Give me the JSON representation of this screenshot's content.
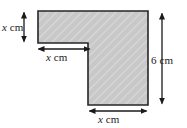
{
  "figure": {
    "kind": "composite-l-shape-diagram",
    "background_color": "#ffffff",
    "shape": {
      "name": "l-shape",
      "fill_color": "#c8c8c8",
      "stroke_color": "#262626",
      "hatch_color": "#ffffff",
      "hatch_angle_deg": 45,
      "vertices": [
        [
          38,
          11
        ],
        [
          148,
          11
        ],
        [
          148,
          105
        ],
        [
          88,
          105
        ],
        [
          88,
          43
        ],
        [
          38,
          43
        ]
      ]
    },
    "dimension_labels": [
      {
        "id": "left-height",
        "variable": "x",
        "unit": "cm",
        "text": "x cm",
        "orientation": "vertical",
        "measures": "left arm height"
      },
      {
        "id": "notch-width",
        "variable": "x",
        "unit": "cm",
        "text": "x cm",
        "orientation": "horizontal",
        "measures": "left arm width"
      },
      {
        "id": "right-height",
        "variable": "6",
        "unit": "cm",
        "text": "6 cm",
        "orientation": "vertical",
        "measures": "overall height"
      },
      {
        "id": "bottom-width",
        "variable": "x",
        "unit": "cm",
        "text": "x cm",
        "orientation": "horizontal",
        "measures": "lower arm width"
      }
    ],
    "arrows": [
      {
        "id": "left-height-arrow",
        "x1": 24,
        "y1": 11,
        "x2": 24,
        "y2": 43,
        "heads": "both"
      },
      {
        "id": "notch-width-arrow",
        "x1": 37,
        "y1": 49,
        "x2": 91,
        "y2": 49,
        "heads": "both"
      },
      {
        "id": "right-height-arrow",
        "x1": 162,
        "y1": 12,
        "x2": 162,
        "y2": 105,
        "heads": "both"
      },
      {
        "id": "bottom-width-arrow",
        "x1": 88,
        "y1": 111,
        "x2": 148,
        "y2": 111,
        "heads": "both"
      }
    ]
  }
}
